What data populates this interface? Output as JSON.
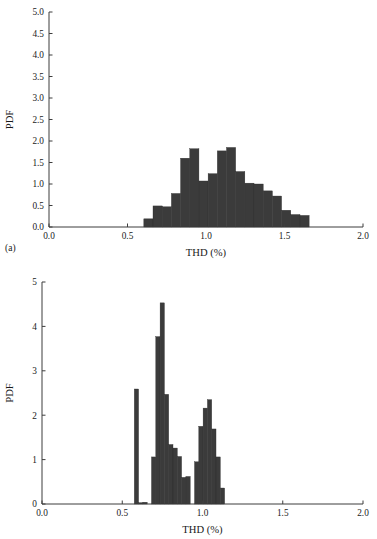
{
  "figure": {
    "name": "thd-pdf-histograms",
    "panels": [
      {
        "id": "a",
        "caption": "(a)"
      },
      {
        "id": "b",
        "caption": "(b)"
      }
    ]
  },
  "chart_data": [
    {
      "type": "bar",
      "subplot": "a",
      "title": "",
      "xlabel": "THD (%)",
      "ylabel": "PDF",
      "xlim": [
        0.0,
        2.0
      ],
      "ylim": [
        0.0,
        5.0
      ],
      "grid": false,
      "legend": null,
      "xticks": [
        "0.0",
        "0.5",
        "1.0",
        "1.5",
        "2.0"
      ],
      "xtick_values": [
        0.0,
        0.5,
        1.0,
        1.5,
        2.0
      ],
      "yticks": [
        "0.0",
        "0.5",
        "1.0",
        "1.5",
        "2.0",
        "2.5",
        "3.0",
        "3.5",
        "4.0",
        "4.5",
        "5.0"
      ],
      "ytick_values": [
        0.0,
        0.5,
        1.0,
        1.5,
        2.0,
        2.5,
        3.0,
        3.5,
        4.0,
        4.5,
        5.0
      ],
      "bin_width": 0.0585,
      "bin_left_edges": [
        0.604,
        0.6625,
        0.721,
        0.7795,
        0.838,
        0.8965,
        0.955,
        1.0135,
        1.072,
        1.1305,
        1.189,
        1.2475,
        1.306,
        1.3645,
        1.423,
        1.4815,
        1.54,
        1.5985,
        1.657
      ],
      "bin_centers": [
        0.633,
        0.692,
        0.75,
        0.809,
        0.867,
        0.926,
        0.984,
        1.043,
        1.101,
        1.16,
        1.218,
        1.277,
        1.335,
        1.394,
        1.452,
        1.511,
        1.569,
        1.628,
        1.686
      ],
      "values": [
        0.19,
        0.49,
        0.47,
        0.78,
        1.6,
        1.82,
        1.07,
        1.24,
        1.77,
        1.85,
        1.29,
        1.02,
        1.0,
        0.84,
        0.72,
        0.39,
        0.29,
        0.27,
        0.0
      ]
    },
    {
      "type": "bar",
      "subplot": "b",
      "title": "",
      "xlabel": "THD (%)",
      "ylabel": "PDF",
      "xlim": [
        0.0,
        2.0
      ],
      "ylim": [
        0,
        5
      ],
      "grid": false,
      "legend": null,
      "xticks": [
        "0.0",
        "0.5",
        "1.0",
        "1.5",
        "2.0"
      ],
      "xtick_values": [
        0.0,
        0.5,
        1.0,
        1.5,
        2.0
      ],
      "yticks": [
        "0",
        "1",
        "2",
        "3",
        "4",
        "5"
      ],
      "ytick_values": [
        0,
        1,
        2,
        3,
        4,
        5
      ],
      "bin_width": 0.0268,
      "bin_left_edges": [
        0.575,
        0.6018,
        0.6286,
        0.6554,
        0.6822,
        0.709,
        0.7358,
        0.7626,
        0.7894,
        0.8162,
        0.843,
        0.8698,
        0.8966,
        0.9234,
        0.9502,
        0.977,
        1.0038,
        1.0306,
        1.0574,
        1.0842,
        1.111,
        1.1378,
        1.1646
      ],
      "bin_centers": [
        0.588,
        0.615,
        0.642,
        0.669,
        0.696,
        0.722,
        0.749,
        0.776,
        0.803,
        0.83,
        0.856,
        0.883,
        0.91,
        0.937,
        0.964,
        0.99,
        1.017,
        1.044,
        1.071,
        1.098,
        1.124,
        1.151,
        1.178
      ],
      "values": [
        2.59,
        0.03,
        0.04,
        0.0,
        1.06,
        3.77,
        4.53,
        2.47,
        1.34,
        1.26,
        1.07,
        0.6,
        0.62,
        0.0,
        0.95,
        1.75,
        2.16,
        2.35,
        1.69,
        1.06,
        0.36,
        0.0,
        0.0
      ]
    }
  ]
}
